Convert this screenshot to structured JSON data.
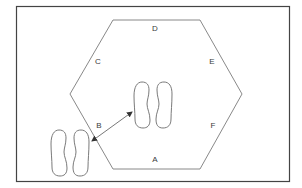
{
  "diagram": {
    "type": "hexagon-layout",
    "border_color": "#444444",
    "line_color": "#7a7a7a",
    "labels": [
      {
        "id": "A",
        "text": "A",
        "x": 155,
        "y": 160
      },
      {
        "id": "B",
        "text": "B",
        "x": 99,
        "y": 126
      },
      {
        "id": "C",
        "text": "C",
        "x": 98,
        "y": 62
      },
      {
        "id": "D",
        "text": "D",
        "x": 155,
        "y": 29
      },
      {
        "id": "E",
        "text": "E",
        "x": 212,
        "y": 62
      },
      {
        "id": "F",
        "text": "F",
        "x": 213,
        "y": 126
      }
    ],
    "hexagon_points": [
      [
        113,
        20
      ],
      [
        200,
        20
      ],
      [
        242,
        94
      ],
      [
        200,
        169
      ],
      [
        113,
        169
      ],
      [
        70,
        94
      ]
    ],
    "footprints": [
      {
        "name": "center-footprints",
        "x": 134,
        "y": 82
      },
      {
        "name": "outside-footprints",
        "x": 51,
        "y": 130
      }
    ],
    "arrow": {
      "from": [
        92,
        141
      ],
      "to": [
        132,
        112
      ],
      "double_headed": true
    }
  }
}
